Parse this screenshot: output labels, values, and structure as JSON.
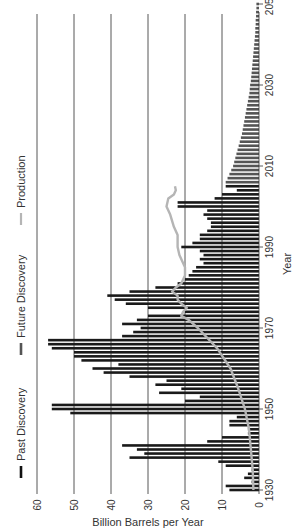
{
  "chart_data": {
    "type": "bar",
    "orientation": "rotated-90-ccw",
    "title": "",
    "xlabel": "Year",
    "ylabel": "Billion Barrels per Year",
    "ylim": [
      0,
      60
    ],
    "xlim": [
      1930,
      2050
    ],
    "yticks": [
      0,
      10,
      20,
      30,
      40,
      50,
      60
    ],
    "xticks": [
      1930,
      1950,
      1970,
      1990,
      2010,
      2030,
      2050
    ],
    "grid": true,
    "legend": {
      "position": "left-top",
      "entries": [
        "Past Discovery",
        "Future Discovery",
        "Production"
      ]
    },
    "series": [
      {
        "name": "Past Discovery",
        "type": "bar",
        "color": "#1a1a1a",
        "x": [
          1930,
          1931,
          1932,
          1933,
          1934,
          1935,
          1936,
          1937,
          1938,
          1939,
          1940,
          1941,
          1942,
          1943,
          1944,
          1945,
          1946,
          1947,
          1948,
          1949,
          1950,
          1951,
          1952,
          1953,
          1954,
          1955,
          1956,
          1957,
          1958,
          1959,
          1960,
          1961,
          1962,
          1963,
          1964,
          1965,
          1966,
          1967,
          1968,
          1969,
          1970,
          1971,
          1972,
          1973,
          1974,
          1975,
          1976,
          1977,
          1978,
          1979,
          1980,
          1981,
          1982,
          1983,
          1984,
          1985,
          1986,
          1987,
          1988,
          1989,
          1990,
          1991,
          1992,
          1993,
          1994,
          1995,
          1996,
          1997,
          1998,
          1999,
          2000,
          2001,
          2002,
          2003,
          2004,
          2005
        ],
        "values": [
          8,
          9,
          2,
          4,
          3,
          2,
          9,
          11,
          35,
          31,
          33,
          37,
          14,
          10,
          3,
          3,
          8,
          8,
          6,
          51,
          56,
          56,
          20,
          16,
          27,
          21,
          28,
          25,
          35,
          42,
          45,
          38,
          48,
          50,
          50,
          56,
          57,
          57,
          37,
          34,
          32,
          37,
          33,
          30,
          20,
          30,
          36,
          39,
          41,
          35,
          28,
          22,
          20,
          19,
          18,
          17,
          15,
          16,
          15,
          16,
          21,
          18,
          16,
          16,
          14,
          13,
          13,
          14,
          15,
          14,
          22,
          22,
          12,
          10,
          6,
          9
        ]
      },
      {
        "name": "Future Discovery",
        "type": "bar",
        "color": "#555555",
        "x": [
          2006,
          2007,
          2008,
          2009,
          2010,
          2011,
          2012,
          2013,
          2014,
          2015,
          2016,
          2017,
          2018,
          2019,
          2020,
          2021,
          2022,
          2023,
          2024,
          2025,
          2026,
          2027,
          2028,
          2029,
          2030,
          2031,
          2032,
          2033,
          2034,
          2035,
          2036,
          2037,
          2038,
          2039,
          2040,
          2041,
          2042,
          2043,
          2044,
          2045,
          2046,
          2047,
          2048,
          2049,
          2050
        ],
        "values": [
          9,
          8.5,
          8,
          7.5,
          7,
          6.7,
          6.4,
          6.1,
          5.8,
          5.5,
          5.2,
          4.9,
          4.6,
          4.4,
          4.2,
          4,
          3.8,
          3.6,
          3.4,
          3.2,
          3,
          2.8,
          2.6,
          2.5,
          2.4,
          2.2,
          2.1,
          2,
          1.9,
          1.8,
          1.7,
          1.6,
          1.5,
          1.4,
          1.3,
          1.2,
          1.1,
          1,
          1,
          0.9,
          0.9,
          0.8,
          0.8,
          0.7,
          0.7
        ]
      },
      {
        "name": "Production",
        "type": "line",
        "color": "#b0b0b0",
        "x": [
          1930,
          1935,
          1940,
          1945,
          1950,
          1955,
          1960,
          1965,
          1970,
          1972,
          1973,
          1974,
          1975,
          1976,
          1977,
          1978,
          1979,
          1980,
          1981,
          1982,
          1983,
          1985,
          1988,
          1990,
          1993,
          1995,
          1998,
          2000,
          2002,
          2003,
          2004,
          2005
        ],
        "values": [
          1.5,
          1.7,
          2.2,
          2.7,
          3.8,
          5.6,
          7.7,
          11.3,
          16.5,
          19,
          21,
          20.5,
          19.5,
          21,
          22,
          22,
          23.5,
          22.5,
          21,
          20.5,
          20,
          20,
          21.5,
          22,
          22,
          23,
          24,
          25,
          24.5,
          23,
          22.5,
          22.7
        ]
      }
    ]
  }
}
